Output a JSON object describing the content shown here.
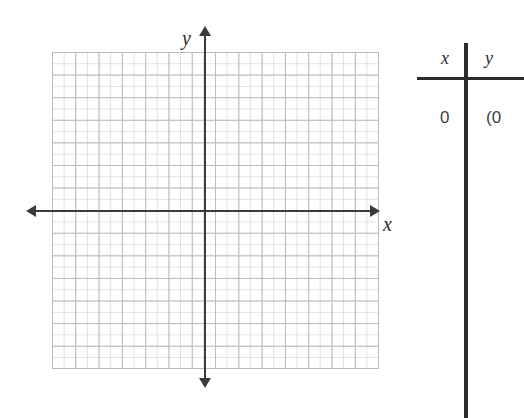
{
  "chart_data": {
    "type": "scatter",
    "title": "",
    "xlabel": "x",
    "ylabel": "y",
    "grid": true,
    "grid_columns": 14,
    "grid_rows": 14,
    "xlim": [
      -7,
      7
    ],
    "ylim": [
      -7,
      7
    ],
    "x": [],
    "y": [],
    "series": [],
    "annotations": []
  },
  "plane": {
    "y_axis_label": "y",
    "x_axis_label": "x",
    "axis_color": "#3a3a3a",
    "grid_color": "#b9b9b9"
  },
  "table": {
    "headers": {
      "x": "x",
      "y": "y"
    },
    "rows": [
      {
        "x": "0",
        "y": "(0"
      }
    ]
  }
}
